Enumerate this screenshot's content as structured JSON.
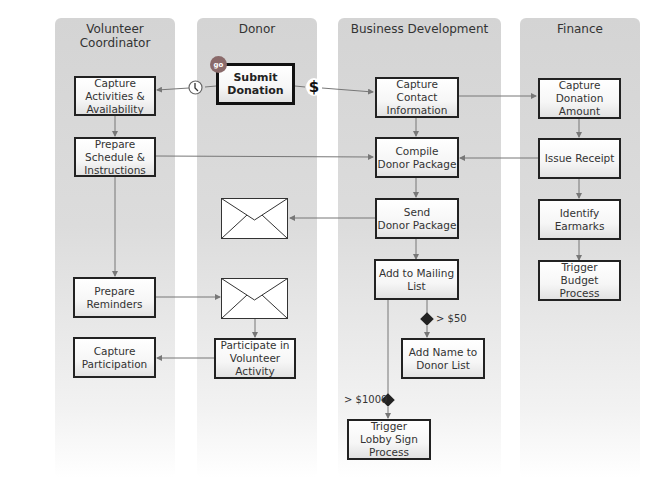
{
  "lanes": [
    {
      "title": "Volunteer Coordinator"
    },
    {
      "title": "Donor"
    },
    {
      "title": "Business Development"
    },
    {
      "title": "Finance"
    }
  ],
  "nodes": {
    "capture_activities": "Capture\nActivities &\nAvailability",
    "prepare_schedule": "Prepare\nSchedule &\nInstructions",
    "prepare_reminders": "Prepare\nReminders",
    "capture_participation": "Capture\nParticipation",
    "submit_donation": "Submit\nDonation",
    "participate": "Participate in\nVolunteer Activity",
    "capture_contact": "Capture\nContact\nInformation",
    "compile_package": "Compile\nDonor Package",
    "send_package": "Send\nDonor Package",
    "add_mailing": "Add to Mailing\nList",
    "add_name": "Add Name to\nDonor List",
    "trigger_lobby": "Trigger\nLobby Sign\nProcess",
    "capture_amount": "Capture\nDonation Amount",
    "issue_receipt": "Issue Receipt",
    "identify_earmarks": "Identify Earmarks",
    "trigger_budget": "Trigger\nBudget Process"
  },
  "badges": {
    "start": "go",
    "dollar": "$"
  },
  "conditions": {
    "gt50": "> $50",
    "gt1000": "> $1000"
  },
  "colors": {
    "lane_bg": "#d4d4d4",
    "box_border": "#222222",
    "go_badge": "#8a6a6a",
    "connector": "#777777"
  }
}
